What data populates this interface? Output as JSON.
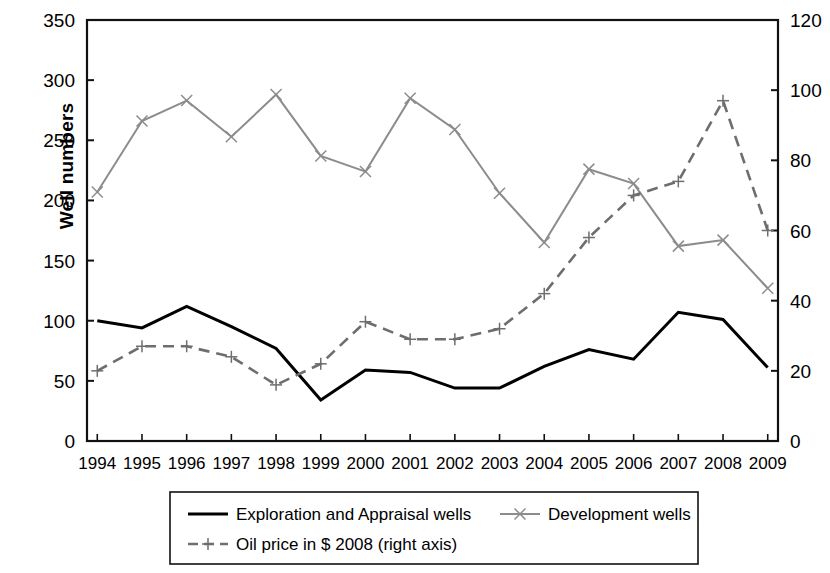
{
  "chart_data": {
    "type": "line",
    "title": "",
    "xlabel": "",
    "ylabel": "Well numbers",
    "ylabel_right": "",
    "grid": false,
    "legend_position": "bottom",
    "categories": [
      "1994",
      "1995",
      "1996",
      "1997",
      "1998",
      "1999",
      "2000",
      "2001",
      "2002",
      "2003",
      "2004",
      "2005",
      "2006",
      "2007",
      "2008",
      "2009"
    ],
    "ylim": [
      0,
      350
    ],
    "yticks": [
      0,
      50,
      100,
      150,
      200,
      250,
      300,
      350
    ],
    "ylim_right": [
      0,
      120
    ],
    "yticks_right": [
      0,
      20,
      40,
      60,
      80,
      100,
      120
    ],
    "series": [
      {
        "name": "Exploration and Appraisal wells",
        "axis": "left",
        "color": "#000000",
        "style": "solid",
        "marker": "none",
        "values": [
          100,
          94,
          112,
          95,
          77,
          34,
          59,
          57,
          44,
          44,
          62,
          76,
          68,
          107,
          101,
          61
        ]
      },
      {
        "name": "Development wells",
        "axis": "left",
        "color": "#8c8c8c",
        "style": "solid",
        "marker": "x",
        "values": [
          207,
          266,
          283,
          253,
          288,
          237,
          224,
          285,
          259,
          206,
          165,
          226,
          214,
          162,
          167,
          127
        ]
      },
      {
        "name": "Oil price in $ 2008 (right axis)",
        "axis": "right",
        "color": "#6e6e6e",
        "style": "dashed",
        "marker": "plus",
        "values": [
          20,
          27,
          27,
          24,
          16,
          22,
          34,
          29,
          29,
          32,
          42,
          58,
          70,
          74,
          97,
          60
        ]
      }
    ],
    "legend": [
      {
        "label": "Exploration and Appraisal wells",
        "color": "#000000",
        "style": "solid",
        "marker": "none"
      },
      {
        "label": "Development wells",
        "color": "#8c8c8c",
        "style": "solid",
        "marker": "x"
      },
      {
        "label": "Oil price in $ 2008 (right axis)",
        "color": "#6e6e6e",
        "style": "dashed",
        "marker": "plus"
      }
    ]
  }
}
